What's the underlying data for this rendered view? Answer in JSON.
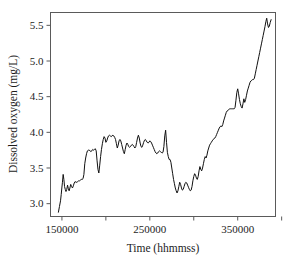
{
  "chart_data": {
    "type": "line",
    "title": "",
    "subtitle": "",
    "xlabel": "Time (hhmmss)",
    "ylabel": "Dissolved oxygen (mg/L)",
    "xlim": [
      137000,
      393000
    ],
    "ylim": [
      2.82,
      5.68
    ],
    "grid": false,
    "legend": null,
    "legend_position": "none",
    "xticks": [
      150000,
      200000,
      250000,
      300000,
      350000,
      400000
    ],
    "xtick_labels": [
      "150000",
      "",
      "250000",
      "",
      "350000",
      ""
    ],
    "yticks": [
      3.0,
      3.5,
      4.0,
      4.5,
      5.0,
      5.5
    ],
    "ytick_labels": [
      "3.0",
      "3.5",
      "4.0",
      "4.5",
      "5.0",
      "5.5"
    ],
    "series": [
      {
        "name": "Dissolved oxygen",
        "color": "#111111",
        "x": [
          146000,
          147200,
          148400,
          149200,
          149900,
          150600,
          151400,
          152200,
          153000,
          153800,
          154600,
          155500,
          156400,
          157300,
          158200,
          159100,
          160000,
          161000,
          162000,
          163000,
          164000,
          165000,
          166000,
          167000,
          168000,
          169000,
          170000,
          171000,
          172000,
          173000,
          174000,
          175000,
          176000,
          177000,
          178000,
          179000,
          180000,
          181000,
          182000,
          183000,
          184000,
          185000,
          186000,
          187000,
          188000,
          189000,
          190000,
          191000,
          192000,
          193000,
          194000,
          195000,
          196000,
          197000,
          198000,
          199000,
          200000,
          201000,
          202000,
          203000,
          204000,
          205000,
          206000,
          207000,
          208000,
          209000,
          210000,
          211000,
          212000,
          213000,
          214000,
          215000,
          216000,
          217000,
          218000,
          219000,
          220000,
          221000,
          222000,
          223000,
          224000,
          225000,
          226000,
          227000,
          228000,
          229000,
          230000,
          231000,
          232000,
          233000,
          234000,
          235000,
          236000,
          237000,
          238000,
          239000,
          240000,
          241000,
          242000,
          243000,
          244000,
          245000,
          246000,
          247000,
          248000,
          249000,
          250000,
          251000,
          252000,
          253000,
          254000,
          255000,
          256000,
          257000,
          258000,
          259000,
          260000,
          261000,
          262000,
          263000,
          264000,
          265000,
          266000,
          267000,
          268000,
          269000,
          270000,
          271000,
          272000,
          273000,
          274000,
          275000,
          276000,
          277000,
          278000,
          279000,
          280000,
          281000,
          282000,
          283000,
          284000,
          285000,
          286000,
          287000,
          288000,
          289000,
          290000,
          291000,
          292000,
          293000,
          294000,
          295000,
          296000,
          297000,
          298000,
          299000,
          300000,
          301000,
          302000,
          303000,
          304000,
          305000,
          306000,
          307000,
          308000,
          309000,
          310000,
          311000,
          312000,
          313000,
          314000,
          315000,
          316000,
          317000,
          318000,
          319000,
          320000,
          321000,
          322000,
          323000,
          324000,
          325000,
          326000,
          327000,
          328000,
          329000,
          330000,
          331000,
          332000,
          333000,
          334000,
          335000,
          336000,
          337000,
          338000,
          339000,
          340000,
          341000,
          342000,
          343000,
          344000,
          345000,
          346000,
          347000,
          348000,
          349000,
          350000,
          351000,
          352000,
          353000,
          354000,
          355000,
          356000,
          357000,
          358000,
          359000,
          360000,
          361000,
          362000,
          363000,
          364000,
          365000,
          366000,
          367000,
          368000,
          369000,
          370000,
          371000,
          372000,
          373000,
          374000,
          375000,
          376000,
          377000,
          378000,
          379000,
          380000,
          381000,
          382000,
          383000,
          384000,
          385000,
          386000,
          387000,
          388000
        ],
        "y": [
          2.88,
          2.96,
          3.04,
          3.13,
          3.22,
          3.3,
          3.41,
          3.34,
          3.24,
          3.2,
          3.17,
          3.2,
          3.26,
          3.21,
          3.18,
          3.22,
          3.27,
          3.24,
          3.22,
          3.25,
          3.29,
          3.31,
          3.3,
          3.3,
          3.31,
          3.32,
          3.32,
          3.33,
          3.34,
          3.34,
          3.35,
          3.41,
          3.56,
          3.64,
          3.7,
          3.74,
          3.75,
          3.75,
          3.74,
          3.73,
          3.74,
          3.76,
          3.75,
          3.76,
          3.77,
          3.74,
          3.6,
          3.48,
          3.43,
          3.54,
          3.66,
          3.76,
          3.84,
          3.9,
          3.94,
          3.92,
          3.86,
          3.88,
          3.92,
          3.95,
          3.96,
          3.95,
          3.94,
          3.95,
          3.96,
          3.95,
          3.93,
          3.9,
          3.84,
          3.78,
          3.82,
          3.88,
          3.9,
          3.88,
          3.83,
          3.78,
          3.73,
          3.7,
          3.76,
          3.82,
          3.85,
          3.83,
          3.8,
          3.79,
          3.8,
          3.82,
          3.83,
          3.82,
          3.8,
          3.78,
          3.8,
          3.86,
          3.92,
          3.96,
          3.92,
          3.85,
          3.8,
          3.79,
          3.82,
          3.86,
          3.89,
          3.9,
          3.88,
          3.86,
          3.85,
          3.86,
          3.88,
          3.87,
          3.85,
          3.82,
          3.79,
          3.76,
          3.73,
          3.71,
          3.7,
          3.71,
          3.73,
          3.74,
          3.73,
          3.72,
          3.71,
          3.72,
          3.8,
          3.95,
          4.03,
          3.86,
          3.72,
          3.66,
          3.62,
          3.62,
          3.58,
          3.5,
          3.42,
          3.34,
          3.28,
          3.22,
          3.18,
          3.15,
          3.18,
          3.24,
          3.3,
          3.27,
          3.22,
          3.19,
          3.2,
          3.24,
          3.28,
          3.3,
          3.29,
          3.26,
          3.23,
          3.2,
          3.18,
          3.19,
          3.24,
          3.32,
          3.38,
          3.42,
          3.4,
          3.36,
          3.34,
          3.38,
          3.46,
          3.52,
          3.48,
          3.46,
          3.5,
          3.56,
          3.62,
          3.66,
          3.64,
          3.68,
          3.74,
          3.78,
          3.82,
          3.84,
          3.86,
          3.88,
          3.9,
          3.91,
          3.92,
          3.94,
          3.97,
          4.0,
          4.03,
          4.06,
          4.08,
          4.09,
          4.08,
          4.11,
          4.16,
          4.2,
          4.24,
          4.28,
          4.3,
          4.31,
          4.32,
          4.33,
          4.33,
          4.33,
          4.33,
          4.33,
          4.33,
          4.35,
          4.45,
          4.56,
          4.61,
          4.54,
          4.46,
          4.4,
          4.36,
          4.34,
          4.4,
          4.47,
          4.42,
          4.46,
          4.52,
          4.58,
          4.62,
          4.66,
          4.7,
          4.72,
          4.73,
          4.74,
          4.74,
          4.76,
          4.82,
          4.88,
          4.94,
          5.0,
          5.06,
          5.12,
          5.18,
          5.24,
          5.3,
          5.36,
          5.42,
          5.48,
          5.55,
          5.6,
          5.52,
          5.47,
          5.49,
          5.54,
          5.58
        ]
      }
    ]
  }
}
